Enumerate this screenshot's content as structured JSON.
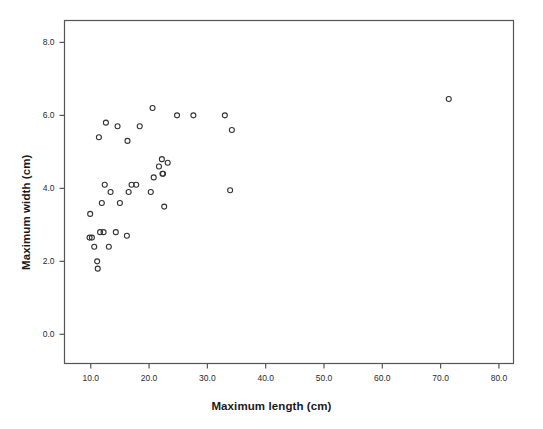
{
  "chart_data": {
    "type": "scatter",
    "title": "",
    "xlabel": "Maximum length (cm)",
    "ylabel": "Maximum width (cm)",
    "xlim": [
      5.5,
      82.5
    ],
    "ylim": [
      -0.8,
      8.6
    ],
    "xticks": [
      "10.0",
      "20.0",
      "30.0",
      "40.0",
      "50.0",
      "60.0",
      "70.0",
      "80.0"
    ],
    "xtick_values": [
      10.0,
      20.0,
      30.0,
      40.0,
      50.0,
      60.0,
      70.0,
      80.0
    ],
    "yticks": [
      "0.0",
      "2.0",
      "4.0",
      "6.0",
      "8.0"
    ],
    "ytick_values": [
      0.0,
      2.0,
      4.0,
      6.0,
      8.0
    ],
    "grid": false,
    "legend": false,
    "marker": "open-circle",
    "marker_color": "#333333",
    "marker_size": 5,
    "frame_color": "#555555",
    "points": [
      {
        "x": 9.9,
        "y": 3.3
      },
      {
        "x": 9.8,
        "y": 2.65
      },
      {
        "x": 10.2,
        "y": 2.65
      },
      {
        "x": 10.6,
        "y": 2.4
      },
      {
        "x": 11.1,
        "y": 2.0
      },
      {
        "x": 11.2,
        "y": 1.8
      },
      {
        "x": 11.4,
        "y": 5.4
      },
      {
        "x": 11.6,
        "y": 2.8
      },
      {
        "x": 11.9,
        "y": 3.6
      },
      {
        "x": 12.2,
        "y": 2.8
      },
      {
        "x": 12.4,
        "y": 4.1
      },
      {
        "x": 12.6,
        "y": 5.8
      },
      {
        "x": 13.1,
        "y": 2.4
      },
      {
        "x": 13.4,
        "y": 3.9
      },
      {
        "x": 14.3,
        "y": 2.8
      },
      {
        "x": 14.6,
        "y": 5.7
      },
      {
        "x": 15.0,
        "y": 3.6
      },
      {
        "x": 16.2,
        "y": 2.7
      },
      {
        "x": 16.3,
        "y": 5.3
      },
      {
        "x": 16.5,
        "y": 3.9
      },
      {
        "x": 17.0,
        "y": 4.1
      },
      {
        "x": 17.8,
        "y": 4.1
      },
      {
        "x": 18.4,
        "y": 5.7
      },
      {
        "x": 20.3,
        "y": 3.9
      },
      {
        "x": 20.6,
        "y": 6.2
      },
      {
        "x": 20.8,
        "y": 4.3
      },
      {
        "x": 21.7,
        "y": 4.6
      },
      {
        "x": 22.2,
        "y": 4.8
      },
      {
        "x": 22.3,
        "y": 4.4
      },
      {
        "x": 22.4,
        "y": 4.4
      },
      {
        "x": 22.6,
        "y": 3.5
      },
      {
        "x": 23.2,
        "y": 4.7
      },
      {
        "x": 24.8,
        "y": 6.0
      },
      {
        "x": 27.6,
        "y": 6.0
      },
      {
        "x": 33.0,
        "y": 6.0
      },
      {
        "x": 33.9,
        "y": 3.95
      },
      {
        "x": 34.2,
        "y": 5.6
      },
      {
        "x": 71.4,
        "y": 6.45
      }
    ]
  }
}
